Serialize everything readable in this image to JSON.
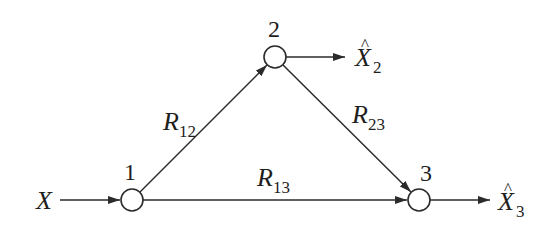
{
  "diagram": {
    "type": "network-flow",
    "nodes": [
      {
        "id": "1",
        "label": "1",
        "cx": 132,
        "cy": 200,
        "r": 11
      },
      {
        "id": "2",
        "label": "2",
        "cx": 275,
        "cy": 57,
        "r": 11
      },
      {
        "id": "3",
        "label": "3",
        "cx": 419,
        "cy": 200,
        "r": 11
      }
    ],
    "source": {
      "symbol": "X",
      "target_node": "1"
    },
    "outputs": [
      {
        "node": "2",
        "symbol": "X",
        "hat": "^",
        "subscript": "2"
      },
      {
        "node": "3",
        "symbol": "X",
        "hat": "^",
        "subscript": "3"
      }
    ],
    "edges": [
      {
        "from": "1",
        "to": "2",
        "rate_symbol": "R",
        "rate_subscript": "12"
      },
      {
        "from": "2",
        "to": "3",
        "rate_symbol": "R",
        "rate_subscript": "23"
      },
      {
        "from": "1",
        "to": "3",
        "rate_symbol": "R",
        "rate_subscript": "13"
      }
    ]
  },
  "labels": {
    "node1": "1",
    "node2": "2",
    "node3": "3",
    "input_symbol": "X",
    "out2_symbol": "X",
    "out2_hat": "^",
    "out2_sub": "2",
    "out3_symbol": "X",
    "out3_hat": "^",
    "out3_sub": "3",
    "r12_symbol": "R",
    "r12_sub": "12",
    "r23_symbol": "R",
    "r23_sub": "23",
    "r13_symbol": "R",
    "r13_sub": "13"
  },
  "colors": {
    "stroke": "#2b2b2b",
    "text": "#1e1e1e",
    "background": "#ffffff"
  }
}
